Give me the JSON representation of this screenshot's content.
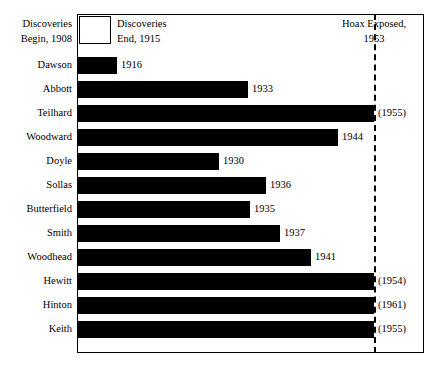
{
  "header": {
    "left_line1": "Discoveries",
    "left_line2": "Begin, 1908",
    "legend_line1": "Discoveries",
    "legend_line2": "End, 1915",
    "hoax_line1": "Hoax Exposed,",
    "hoax_line2": "1953"
  },
  "chart_data": {
    "type": "bar",
    "orientation": "horizontal",
    "title": "",
    "xlabel": "",
    "ylabel": "",
    "xlim": [
      1908,
      1962
    ],
    "grid": false,
    "legend_position": "top-left",
    "start_year": 1908,
    "legend_end_year": 1915,
    "reference_line": {
      "label": "Hoax Exposed,",
      "value": 1953,
      "style": "dashed"
    },
    "categories": [
      "Dawson",
      "Abbott",
      "Teilhard",
      "Woodward",
      "Doyle",
      "Sollas",
      "Butterfield",
      "Smith",
      "Woodhead",
      "Hewitt",
      "Hinton",
      "Keith"
    ],
    "values": [
      1916,
      1933,
      1953,
      1944,
      1930,
      1936,
      1935,
      1937,
      1941,
      1953,
      1953,
      1953
    ],
    "value_labels": [
      "1916",
      "1933",
      "(1955)",
      "1944",
      "1930",
      "1936",
      "1935",
      "1937",
      "1941",
      "(1954)",
      "(1961)",
      "(1955)"
    ],
    "rows": [
      {
        "name": "Dawson",
        "value": 1916,
        "label": "1916",
        "bar_end_px": 117
      },
      {
        "name": "Abbott",
        "value": 1933,
        "label": "1933",
        "bar_end_px": 248
      },
      {
        "name": "Teilhard",
        "value": 1953,
        "label": "(1955)",
        "bar_end_px": 374
      },
      {
        "name": "Woodward",
        "value": 1944,
        "label": "1944",
        "bar_end_px": 338
      },
      {
        "name": "Doyle",
        "value": 1930,
        "label": "1930",
        "bar_end_px": 219
      },
      {
        "name": "Sollas",
        "value": 1936,
        "label": "1936",
        "bar_end_px": 266
      },
      {
        "name": "Butterfield",
        "value": 1935,
        "label": "1935",
        "bar_end_px": 250
      },
      {
        "name": "Smith",
        "value": 1937,
        "label": "1937",
        "bar_end_px": 280
      },
      {
        "name": "Woodhead",
        "value": 1941,
        "label": "1941",
        "bar_end_px": 311
      },
      {
        "name": "Hewitt",
        "value": 1953,
        "label": "(1954)",
        "bar_end_px": 374
      },
      {
        "name": "Hinton",
        "value": 1953,
        "label": "(1961)",
        "bar_end_px": 374
      },
      {
        "name": "Keith",
        "value": 1953,
        "label": "(1955)",
        "bar_end_px": 374
      }
    ]
  },
  "geometry": {
    "plot_left_px": 78,
    "hoax_line_px": 374,
    "row_top_start_px": 53,
    "row_pitch_px": 24
  }
}
